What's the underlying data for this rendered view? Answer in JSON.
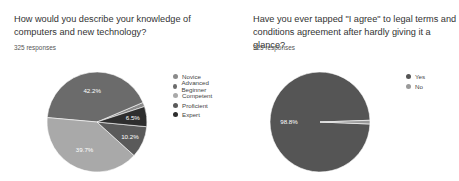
{
  "chart_data": [
    {
      "type": "pie",
      "title": "How would you describe your knowledge of computers and new technology?",
      "subtitle": "325 responses",
      "categories": [
        "Novice",
        "Advanced Beginner",
        "Competent",
        "Proficient",
        "Expert"
      ],
      "values": [
        1.4,
        42.2,
        39.7,
        10.2,
        6.5
      ],
      "labels_shown": [
        "",
        "42.2%",
        "39.7%",
        "10.2%",
        "6.5%"
      ],
      "colors": [
        "#8a8a8a",
        "#6b6b6b",
        "#a9a9a9",
        "#5a5a5a",
        "#2e2e2e"
      ],
      "legend_position": "right"
    },
    {
      "type": "pie",
      "title": "Have you ever tapped \"I agree\" to legal terms and conditions agreement after hardly giving it a glance?",
      "subtitle": "325 responses",
      "categories": [
        "Yes",
        "No"
      ],
      "values": [
        98.8,
        1.2
      ],
      "labels_shown": [
        "98.8%",
        ""
      ],
      "colors": [
        "#555555",
        "#9a9a9a"
      ],
      "legend_position": "right"
    }
  ],
  "left": {
    "title": "How would you describe your knowledge of computers and new technology?",
    "responses": "325 responses",
    "legend": [
      "Novice",
      "Advanced Beginner",
      "Competent",
      "Proficient",
      "Expert"
    ]
  },
  "right": {
    "title": "Have you ever tapped \"I agree\" to legal terms and conditions agreement after hardly giving it a glance?",
    "responses": "325 responses",
    "legend": [
      "Yes",
      "No"
    ]
  }
}
